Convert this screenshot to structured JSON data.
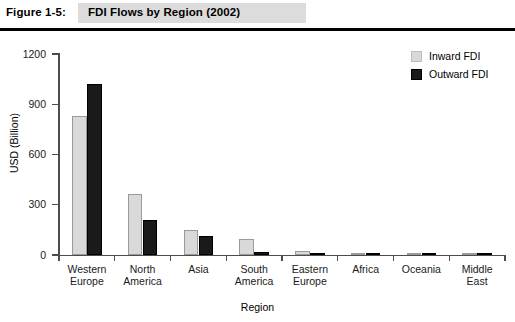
{
  "figure": {
    "number_label": "Figure 1-5:",
    "title": "FDI Flows by Region (2002)"
  },
  "legend": {
    "items": [
      {
        "label": "Inward FDI",
        "color": "#d9d9d9",
        "swatch": "inward"
      },
      {
        "label": "Outward FDI",
        "color": "#1a1a1a",
        "swatch": "outward"
      }
    ]
  },
  "axes": {
    "y_title": "USD (Billion)",
    "x_title": "Region",
    "y_ticks": [
      "0",
      "300",
      "600",
      "900",
      "1200"
    ]
  },
  "chart_data": {
    "type": "bar",
    "title": "FDI Flows by Region (2002)",
    "xlabel": "Region",
    "ylabel": "USD (Billion)",
    "ylim": [
      0,
      1200
    ],
    "ytick_values": [
      0,
      300,
      600,
      900,
      1200
    ],
    "grid": false,
    "legend_position": "top-right",
    "categories": [
      "Western Europe",
      "North America",
      "Asia",
      "South America",
      "Eastern Europe",
      "Africa",
      "Oceania",
      "Middle East"
    ],
    "category_lines": [
      [
        "Western",
        "Europe"
      ],
      [
        "North",
        "America"
      ],
      [
        "Asia",
        ""
      ],
      [
        "South",
        "America"
      ],
      [
        "Eastern",
        "Europe"
      ],
      [
        "Africa",
        ""
      ],
      [
        "Oceania",
        ""
      ],
      [
        "Middle",
        "East"
      ]
    ],
    "series": [
      {
        "name": "Inward FDI",
        "color": "#d9d9d9",
        "values": [
          830,
          365,
          150,
          95,
          25,
          8,
          12,
          3
        ]
      },
      {
        "name": "Outward FDI",
        "color": "#1a1a1a",
        "values": [
          1020,
          210,
          115,
          20,
          12,
          2,
          5,
          2
        ]
      }
    ]
  }
}
